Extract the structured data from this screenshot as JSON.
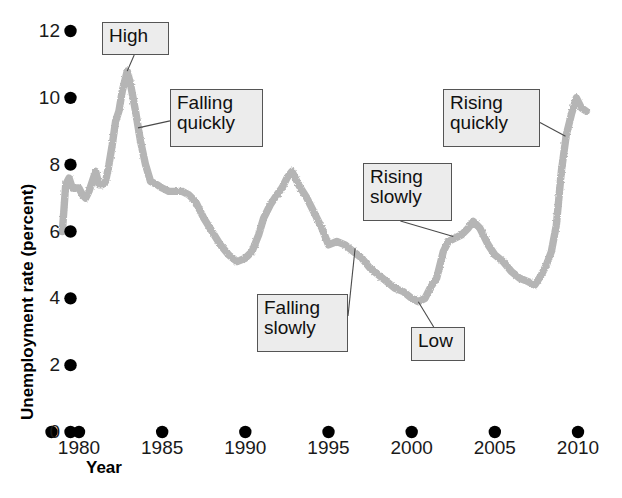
{
  "chart_data": {
    "type": "line",
    "title": "",
    "subtitle": "",
    "xlabel": "Year",
    "ylabel": "Unemployment rate (percent)",
    "xlim": [
      1978.8,
      2010.8
    ],
    "ylim": [
      0,
      12.6
    ],
    "grid": false,
    "legend": null,
    "series_color": "#b5b5b5",
    "axis_color": "#000000",
    "x_ticks": [
      1980,
      1985,
      1990,
      1995,
      2000,
      2005,
      2010
    ],
    "x_tick_labels": [
      "1980",
      "1985",
      "1990",
      "1995",
      "2000",
      "2005",
      "2010"
    ],
    "y_ticks": [
      0,
      2,
      4,
      6,
      8,
      10,
      12
    ],
    "y_tick_labels": [
      "0",
      "2",
      "4",
      "6",
      "8",
      "10",
      "12"
    ],
    "series": [
      {
        "name": "Unemployment rate",
        "x": [
          1979.0,
          1979.2,
          1979.4,
          1979.6,
          1979.8,
          1980.0,
          1980.2,
          1980.4,
          1980.6,
          1980.8,
          1981.0,
          1981.2,
          1981.4,
          1981.6,
          1981.8,
          1982.0,
          1982.2,
          1982.4,
          1982.6,
          1982.9,
          1983.1,
          1983.4,
          1983.7,
          1984.0,
          1984.3,
          1984.7,
          1985.0,
          1985.4,
          1985.8,
          1986.2,
          1986.6,
          1987.0,
          1987.5,
          1988.0,
          1988.5,
          1989.0,
          1989.5,
          1990.0,
          1990.4,
          1990.8,
          1991.1,
          1991.5,
          1991.9,
          1992.2,
          1992.5,
          1992.8,
          1993.2,
          1993.7,
          1994.1,
          1994.6,
          1995.0,
          1995.5,
          1996.0,
          1996.5,
          1997.0,
          1997.5,
          1998.0,
          1998.5,
          1999.0,
          1999.5,
          2000.0,
          2000.4,
          2000.8,
          2001.1,
          2001.5,
          2001.9,
          2002.2,
          2002.6,
          2003.0,
          2003.4,
          2003.7,
          2004.1,
          2004.6,
          2005.0,
          2005.5,
          2006.0,
          2006.5,
          2007.0,
          2007.4,
          2007.8,
          2008.1,
          2008.4,
          2008.7,
          2009.0,
          2009.3,
          2009.6,
          2009.9,
          2010.2,
          2010.5
        ],
        "y": [
          6.0,
          7.4,
          7.6,
          7.3,
          7.3,
          7.3,
          7.1,
          7.0,
          7.2,
          7.5,
          7.8,
          7.4,
          7.4,
          7.5,
          8.0,
          8.6,
          9.3,
          9.6,
          10.2,
          10.8,
          10.4,
          9.6,
          8.7,
          8.0,
          7.5,
          7.4,
          7.3,
          7.2,
          7.2,
          7.2,
          7.1,
          6.9,
          6.4,
          6.0,
          5.6,
          5.3,
          5.1,
          5.2,
          5.4,
          5.9,
          6.4,
          6.8,
          7.1,
          7.3,
          7.6,
          7.8,
          7.4,
          7.0,
          6.6,
          6.1,
          5.6,
          5.7,
          5.6,
          5.4,
          5.2,
          4.9,
          4.7,
          4.5,
          4.3,
          4.2,
          4.0,
          3.9,
          4.0,
          4.3,
          4.6,
          5.4,
          5.7,
          5.8,
          5.9,
          6.1,
          6.3,
          6.1,
          5.6,
          5.3,
          5.1,
          4.8,
          4.6,
          4.5,
          4.4,
          4.7,
          5.0,
          5.4,
          6.2,
          7.8,
          8.9,
          9.5,
          10.0,
          9.7,
          9.6
        ]
      }
    ],
    "annotations": [
      {
        "id": "high",
        "label": "High",
        "description": "Peak unemployment around 10.8 percent in late 1982",
        "target_x": 1982.9,
        "target_y": 10.8
      },
      {
        "id": "falling-quickly",
        "label": "Falling\nquickly",
        "description": "Rapid decline after the 1982 peak",
        "target_x": 1983.55,
        "target_y": 9.1
      },
      {
        "id": "falling-slowly",
        "label": "Falling\nslowly",
        "description": "Gradual decline through the 1990s",
        "target_x": 1996.6,
        "target_y": 5.5
      },
      {
        "id": "low",
        "label": "Low",
        "description": "Trough near 3.9 percent around 2000",
        "target_x": 2000.4,
        "target_y": 3.9
      },
      {
        "id": "rising-slowly",
        "label": "Rising\nslowly",
        "description": "Gradual increase from 2001 to 2003",
        "target_x": 2002.5,
        "target_y": 5.85
      },
      {
        "id": "rising-quickly",
        "label": "Rising\nquickly",
        "description": "Sharp increase during the 2008-2009 recession",
        "target_x": 2009.25,
        "target_y": 8.85
      }
    ]
  },
  "axis_titles": {
    "x": "Year",
    "y": "Unemployment rate (percent)"
  }
}
